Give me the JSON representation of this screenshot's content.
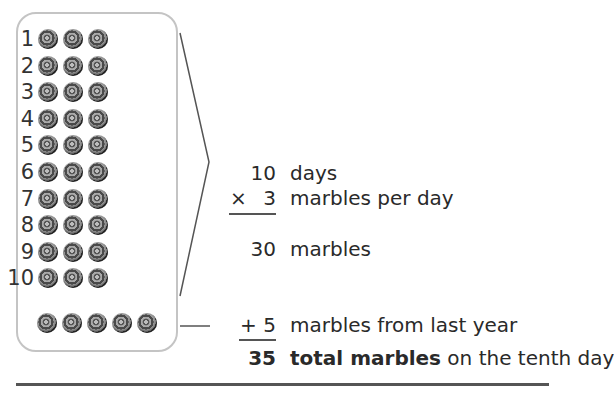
{
  "diagram": {
    "rows": [
      {
        "label": "1",
        "marbles": 3
      },
      {
        "label": "2",
        "marbles": 3
      },
      {
        "label": "3",
        "marbles": 3
      },
      {
        "label": "4",
        "marbles": 3
      },
      {
        "label": "5",
        "marbles": 3
      },
      {
        "label": "6",
        "marbles": 3
      },
      {
        "label": "7",
        "marbles": 3
      },
      {
        "label": "8",
        "marbles": 3
      },
      {
        "label": "9",
        "marbles": 3
      },
      {
        "label": "10",
        "marbles": 3
      }
    ],
    "extra_marbles": 5
  },
  "calculation": {
    "line1": {
      "number": "10",
      "text": "days"
    },
    "line2": {
      "operator": "×",
      "number": "3",
      "text": "marbles per day"
    },
    "line3": {
      "number": "30",
      "text": "marbles"
    },
    "line4": {
      "operator": "+",
      "number": "5",
      "text": "marbles from last year"
    },
    "line5": {
      "number": "35",
      "bold_text": "total marbles",
      "text": " on the tenth day"
    }
  }
}
